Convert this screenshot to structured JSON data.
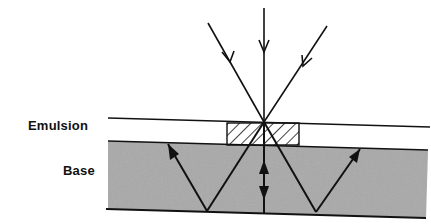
{
  "diagram": {
    "type": "cross-section light-path diagram",
    "labels": {
      "emulsion": "Emulsion",
      "base": "Base"
    },
    "layers": [
      {
        "name": "Emulsion",
        "fill": "#ffffff",
        "note": "thin layer with hatched exposed region"
      },
      {
        "name": "Base",
        "fill": "#a8a8a8",
        "note": "stippled gray substrate"
      }
    ],
    "incident_rays": 3,
    "reflected_rays_in_base": 3,
    "colors": {
      "line": "#111111",
      "base_fill": "#a8a8a8",
      "background": "#ffffff"
    }
  }
}
